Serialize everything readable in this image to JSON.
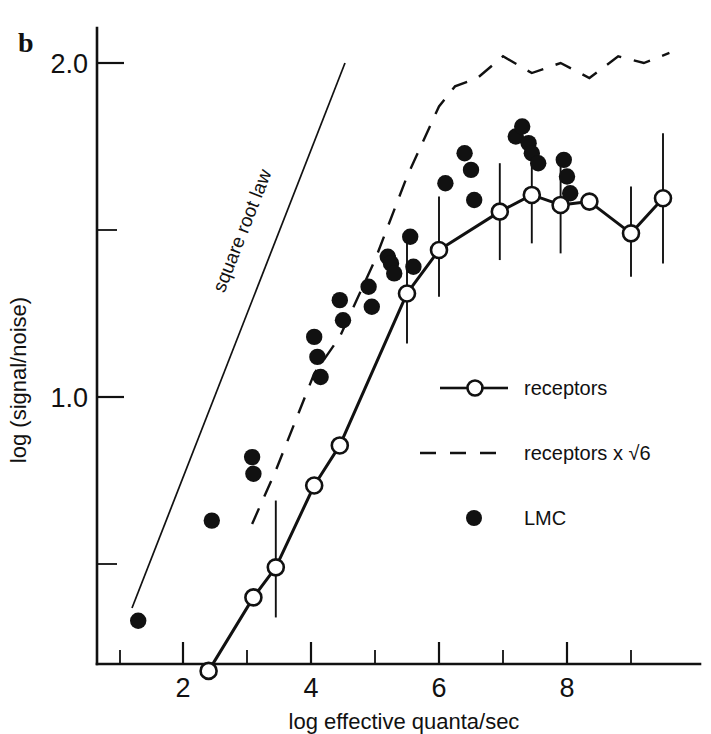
{
  "panel": {
    "letter": "b"
  },
  "chart_data": {
    "type": "scatter",
    "title": "",
    "subtitle": "",
    "xlabel": "log effective quanta/sec",
    "ylabel": "log (signal/noise)",
    "xlim": [
      0.75,
      9.9
    ],
    "ylim": [
      0.05,
      2.22
    ],
    "grid": false,
    "legend_position": "center-right",
    "x_ticks_major": [
      2,
      4,
      6,
      8
    ],
    "x_ticks_major_labels": [
      "2",
      "4",
      "6",
      "8"
    ],
    "x_ticks_minor": [
      1,
      3,
      5,
      7,
      9
    ],
    "y_ticks_major": [
      1.0,
      2.0
    ],
    "y_ticks_major_labels": [
      "1.0",
      "2.0"
    ],
    "y_ticks_minor": [
      0.5,
      1.5
    ],
    "annotations": [
      {
        "text": "square root law",
        "x": 3.05,
        "y": 1.28,
        "rotation": -67
      }
    ],
    "reference_lines": [
      {
        "name": "square root law",
        "style": "solid",
        "slope_note": "slope 0.5 in log-log",
        "x_start": 1.6,
        "y_start": 0.22,
        "x_end": 4.95,
        "y_end": 2.03
      }
    ],
    "series": [
      {
        "name": "receptors",
        "marker": "open-circle",
        "line": "solid",
        "x": [
          2.4,
          3.1,
          3.45,
          4.05,
          4.45,
          5.5,
          6.0,
          6.95,
          7.45,
          7.9,
          8.35,
          9.0,
          9.5
        ],
        "y": [
          0.18,
          0.4,
          0.49,
          0.735,
          0.855,
          1.31,
          1.44,
          1.555,
          1.605,
          1.575,
          1.585,
          1.49,
          1.595
        ],
        "error_bars": [
          {
            "x": 3.45,
            "y": 0.49,
            "low": 0.34,
            "high": 0.69
          },
          {
            "x": 5.5,
            "y": 1.31,
            "low": 1.16,
            "high": 1.47
          },
          {
            "x": 6.0,
            "y": 1.44,
            "low": 1.3,
            "high": 1.6
          },
          {
            "x": 6.95,
            "y": 1.555,
            "low": 1.41,
            "high": 1.7
          },
          {
            "x": 7.45,
            "y": 1.605,
            "low": 1.46,
            "high": 1.75
          },
          {
            "x": 7.9,
            "y": 1.575,
            "low": 1.43,
            "high": 1.72
          },
          {
            "x": 9.0,
            "y": 1.49,
            "low": 1.36,
            "high": 1.63
          },
          {
            "x": 9.5,
            "y": 1.595,
            "low": 1.4,
            "high": 1.79
          }
        ]
      },
      {
        "name": "receptors x √6",
        "marker": "none",
        "line": "dashed",
        "x": [
          3.08,
          3.45,
          4.05,
          4.45,
          5.0,
          5.5,
          6.0,
          6.25,
          6.6,
          7.0,
          7.45,
          7.9,
          8.35,
          8.8,
          9.2,
          9.6
        ],
        "y": [
          0.62,
          0.78,
          1.07,
          1.18,
          1.41,
          1.66,
          1.87,
          1.93,
          1.955,
          2.02,
          1.97,
          2.0,
          1.955,
          2.02,
          2.0,
          2.03
        ]
      },
      {
        "name": "LMC",
        "marker": "filled-circle",
        "line": "none",
        "x": [
          1.3,
          2.45,
          3.08,
          3.1,
          4.05,
          4.1,
          4.15,
          4.45,
          4.5,
          4.9,
          4.95,
          5.2,
          5.25,
          5.3,
          5.55,
          5.6,
          6.1,
          6.4,
          6.5,
          6.55,
          7.2,
          7.3,
          7.4,
          7.45,
          7.55,
          7.95,
          8.0,
          8.05
        ],
        "y": [
          0.33,
          0.63,
          0.82,
          0.77,
          1.18,
          1.12,
          1.06,
          1.29,
          1.23,
          1.33,
          1.27,
          1.42,
          1.4,
          1.37,
          1.48,
          1.39,
          1.64,
          1.73,
          1.68,
          1.59,
          1.78,
          1.81,
          1.76,
          1.73,
          1.7,
          1.71,
          1.66,
          1.61
        ]
      }
    ]
  },
  "legend": {
    "entries": [
      {
        "label": "receptors",
        "style": "solid-line-open-circle"
      },
      {
        "label": "receptors x √6",
        "style": "dashed-line"
      },
      {
        "label": "LMC",
        "style": "filled-circle"
      }
    ]
  }
}
